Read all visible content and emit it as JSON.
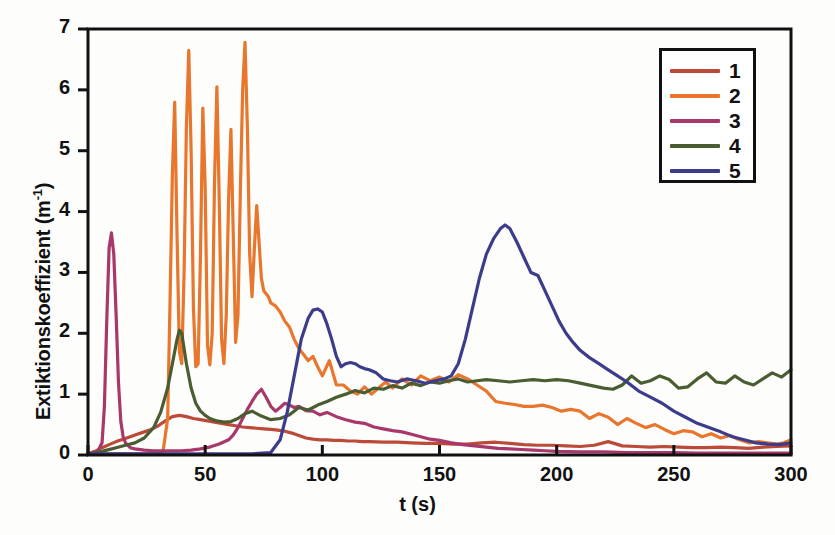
{
  "chart_data": {
    "type": "line",
    "title": "",
    "xlabel": "t (s)",
    "ylabel_text": "Extiktionskoeffizient (m",
    "ylabel_sup": "-1",
    "ylabel_tail": ")",
    "ylabel_full": "Extiktionskoeffizient (m-1)",
    "xlim": [
      0,
      300
    ],
    "ylim": [
      0,
      7
    ],
    "xticks": [
      0,
      50,
      100,
      150,
      200,
      250,
      300
    ],
    "yticks": [
      0,
      1,
      2,
      3,
      4,
      5,
      6,
      7
    ],
    "xtick_labels": [
      "0",
      "50",
      "100",
      "150",
      "200",
      "250",
      "300"
    ],
    "ytick_labels": [
      "0",
      "1",
      "2",
      "3",
      "4",
      "5",
      "6",
      "7"
    ],
    "grid": false,
    "legend_position": "top-right",
    "legend_entries": [
      "1",
      "2",
      "3",
      "4",
      "5"
    ],
    "colors": {
      "series1": "#bb4a38",
      "series2": "#e8762c",
      "series3": "#a8376a",
      "series4": "#4a5c31",
      "series5": "#3c3c8c",
      "axis": "#111111",
      "background": "#ffffff"
    },
    "series": [
      {
        "name": "1",
        "color": "#bb4a38",
        "x": [
          0,
          3,
          6,
          9,
          12,
          15,
          18,
          21,
          24,
          27,
          30,
          33,
          36,
          39,
          42,
          45,
          48,
          51,
          54,
          57,
          60,
          63,
          66,
          69,
          72,
          75,
          78,
          81,
          84,
          87,
          90,
          93,
          96,
          99,
          102,
          105,
          108,
          111,
          114,
          117,
          120,
          126,
          132,
          138,
          144,
          150,
          156,
          162,
          168,
          174,
          180,
          186,
          192,
          198,
          204,
          210,
          216,
          222,
          228,
          234,
          240,
          246,
          252,
          258,
          264,
          270,
          276,
          282,
          288,
          294,
          300
        ],
        "y": [
          0.02,
          0.06,
          0.12,
          0.17,
          0.22,
          0.26,
          0.3,
          0.34,
          0.38,
          0.42,
          0.48,
          0.56,
          0.63,
          0.65,
          0.63,
          0.6,
          0.58,
          0.56,
          0.54,
          0.52,
          0.5,
          0.48,
          0.46,
          0.45,
          0.44,
          0.43,
          0.42,
          0.41,
          0.39,
          0.36,
          0.32,
          0.28,
          0.26,
          0.25,
          0.25,
          0.24,
          0.24,
          0.23,
          0.23,
          0.22,
          0.22,
          0.21,
          0.21,
          0.2,
          0.19,
          0.19,
          0.18,
          0.18,
          0.2,
          0.21,
          0.19,
          0.17,
          0.16,
          0.16,
          0.15,
          0.14,
          0.16,
          0.22,
          0.15,
          0.14,
          0.13,
          0.14,
          0.13,
          0.12,
          0.12,
          0.13,
          0.12,
          0.11,
          0.13,
          0.14,
          0.15
        ]
      },
      {
        "name": "2",
        "color": "#e8762c",
        "x": [
          0,
          5,
          10,
          15,
          20,
          25,
          30,
          32,
          34,
          35,
          36,
          37,
          38,
          39,
          40,
          41,
          42,
          43,
          44,
          45,
          46,
          47,
          48,
          49,
          50,
          51,
          52,
          53,
          54,
          55,
          56,
          57,
          58,
          59,
          60,
          61,
          62,
          63,
          64,
          65,
          66,
          67,
          68,
          69,
          70,
          71,
          72,
          73,
          74,
          75,
          76,
          77,
          78,
          80,
          82,
          84,
          86,
          88,
          90,
          92,
          94,
          96,
          98,
          100,
          103,
          106,
          109,
          112,
          115,
          118,
          121,
          124,
          127,
          130,
          134,
          138,
          142,
          146,
          150,
          154,
          158,
          162,
          166,
          170,
          174,
          178,
          182,
          186,
          190,
          194,
          198,
          202,
          206,
          210,
          214,
          218,
          222,
          226,
          230,
          234,
          238,
          242,
          246,
          250,
          254,
          258,
          262,
          266,
          270,
          274,
          278,
          282,
          286,
          290,
          294,
          297,
          300
        ],
        "y": [
          0.02,
          0.02,
          0.02,
          0.02,
          0.02,
          0.02,
          0.03,
          0.05,
          0.6,
          2.5,
          4.6,
          5.8,
          3.6,
          1.7,
          1.5,
          3.0,
          5.4,
          6.65,
          5.0,
          2.4,
          1.45,
          1.5,
          3.3,
          5.7,
          4.4,
          1.8,
          1.48,
          2.0,
          4.5,
          6.05,
          4.2,
          1.9,
          1.5,
          2.3,
          4.2,
          5.35,
          3.6,
          1.85,
          2.3,
          4.3,
          6.0,
          6.78,
          5.4,
          3.3,
          2.6,
          3.4,
          4.1,
          3.5,
          2.9,
          2.7,
          2.65,
          2.6,
          2.5,
          2.45,
          2.35,
          2.2,
          2.1,
          1.9,
          1.75,
          1.65,
          1.55,
          1.62,
          1.45,
          1.3,
          1.55,
          1.15,
          1.15,
          1.05,
          1.0,
          1.12,
          1.0,
          1.1,
          1.2,
          1.1,
          1.25,
          1.15,
          1.3,
          1.22,
          1.28,
          1.2,
          1.32,
          1.25,
          1.15,
          1.05,
          0.88,
          0.85,
          0.83,
          0.8,
          0.8,
          0.82,
          0.78,
          0.72,
          0.75,
          0.72,
          0.6,
          0.68,
          0.62,
          0.5,
          0.6,
          0.52,
          0.45,
          0.5,
          0.42,
          0.35,
          0.4,
          0.38,
          0.3,
          0.35,
          0.28,
          0.32,
          0.25,
          0.2,
          0.22,
          0.2,
          0.18,
          0.2,
          0.25
        ]
      },
      {
        "name": "3",
        "color": "#a8376a",
        "x": [
          0,
          2,
          4,
          6,
          7,
          8,
          9,
          10,
          11,
          12,
          13,
          14,
          15,
          16,
          18,
          20,
          24,
          28,
          32,
          36,
          40,
          44,
          48,
          52,
          56,
          60,
          62,
          64,
          66,
          68,
          70,
          72,
          74,
          76,
          78,
          80,
          82,
          84,
          86,
          88,
          90,
          93,
          96,
          99,
          102,
          106,
          110,
          114,
          118,
          122,
          126,
          130,
          134,
          138,
          142,
          146,
          150,
          155,
          160,
          165,
          170,
          175,
          180,
          185,
          190,
          195,
          200,
          210,
          220,
          230,
          240,
          250,
          260,
          270,
          280,
          290,
          300
        ],
        "y": [
          0.02,
          0.03,
          0.05,
          0.2,
          0.8,
          2.2,
          3.4,
          3.65,
          3.3,
          2.3,
          1.2,
          0.55,
          0.3,
          0.2,
          0.12,
          0.1,
          0.08,
          0.07,
          0.07,
          0.07,
          0.07,
          0.08,
          0.1,
          0.13,
          0.18,
          0.25,
          0.33,
          0.45,
          0.6,
          0.75,
          0.88,
          1.0,
          1.08,
          0.95,
          0.8,
          0.72,
          0.78,
          0.85,
          0.82,
          0.78,
          0.8,
          0.73,
          0.72,
          0.66,
          0.7,
          0.63,
          0.58,
          0.54,
          0.52,
          0.46,
          0.43,
          0.4,
          0.38,
          0.34,
          0.3,
          0.26,
          0.24,
          0.2,
          0.17,
          0.15,
          0.13,
          0.11,
          0.1,
          0.09,
          0.08,
          0.07,
          0.06,
          0.05,
          0.05,
          0.04,
          0.04,
          0.04,
          0.03,
          0.03,
          0.03,
          0.03,
          0.03
        ]
      },
      {
        "name": "4",
        "color": "#4a5c31",
        "x": [
          0,
          4,
          8,
          12,
          16,
          20,
          24,
          28,
          31,
          34,
          36,
          38,
          39,
          40,
          41,
          42,
          44,
          46,
          48,
          50,
          52,
          55,
          58,
          61,
          64,
          67,
          70,
          74,
          78,
          82,
          86,
          90,
          94,
          98,
          102,
          106,
          110,
          114,
          118,
          122,
          126,
          130,
          134,
          138,
          142,
          146,
          150,
          154,
          158,
          162,
          166,
          170,
          175,
          180,
          185,
          190,
          195,
          200,
          205,
          210,
          215,
          220,
          224,
          228,
          232,
          236,
          240,
          244,
          248,
          252,
          256,
          260,
          264,
          268,
          272,
          276,
          280,
          284,
          288,
          292,
          296,
          300
        ],
        "y": [
          0.02,
          0.04,
          0.08,
          0.12,
          0.16,
          0.2,
          0.28,
          0.45,
          0.7,
          1.1,
          1.5,
          1.9,
          2.05,
          2.0,
          1.75,
          1.5,
          1.1,
          0.85,
          0.72,
          0.65,
          0.6,
          0.56,
          0.54,
          0.55,
          0.6,
          0.68,
          0.72,
          0.64,
          0.58,
          0.6,
          0.66,
          0.78,
          0.74,
          0.82,
          0.88,
          0.95,
          1.0,
          1.06,
          1.02,
          1.1,
          1.08,
          1.14,
          1.1,
          1.18,
          1.14,
          1.2,
          1.18,
          1.22,
          1.25,
          1.2,
          1.22,
          1.24,
          1.22,
          1.2,
          1.22,
          1.24,
          1.22,
          1.24,
          1.22,
          1.18,
          1.14,
          1.1,
          1.08,
          1.15,
          1.3,
          1.18,
          1.22,
          1.3,
          1.24,
          1.1,
          1.12,
          1.25,
          1.35,
          1.2,
          1.18,
          1.3,
          1.2,
          1.15,
          1.25,
          1.35,
          1.28,
          1.4
        ]
      },
      {
        "name": "5",
        "color": "#3c3c8c",
        "x": [
          0,
          10,
          20,
          30,
          40,
          50,
          60,
          70,
          78,
          82,
          85,
          88,
          91,
          94,
          96,
          98,
          100,
          102,
          104,
          106,
          108,
          110,
          112,
          114,
          116,
          118,
          120,
          123,
          126,
          129,
          132,
          136,
          140,
          144,
          148,
          152,
          155,
          158,
          161,
          164,
          167,
          170,
          173,
          176,
          178,
          180,
          183,
          186,
          189,
          192,
          195,
          198,
          201,
          204,
          207,
          210,
          214,
          218,
          222,
          226,
          230,
          235,
          240,
          245,
          250,
          255,
          260,
          265,
          270,
          275,
          280,
          285,
          290,
          295,
          300
        ],
        "y": [
          0.02,
          0.02,
          0.02,
          0.02,
          0.02,
          0.02,
          0.02,
          0.02,
          0.04,
          0.25,
          0.7,
          1.3,
          1.9,
          2.25,
          2.38,
          2.4,
          2.35,
          2.15,
          1.9,
          1.62,
          1.45,
          1.5,
          1.52,
          1.5,
          1.45,
          1.42,
          1.4,
          1.35,
          1.25,
          1.22,
          1.2,
          1.25,
          1.22,
          1.18,
          1.22,
          1.25,
          1.3,
          1.5,
          1.9,
          2.4,
          2.9,
          3.3,
          3.55,
          3.72,
          3.78,
          3.72,
          3.5,
          3.25,
          3.0,
          2.95,
          2.7,
          2.45,
          2.2,
          2.0,
          1.85,
          1.72,
          1.6,
          1.5,
          1.4,
          1.3,
          1.2,
          1.05,
          0.95,
          0.85,
          0.72,
          0.62,
          0.52,
          0.45,
          0.38,
          0.3,
          0.25,
          0.2,
          0.18,
          0.17,
          0.2
        ]
      }
    ]
  }
}
